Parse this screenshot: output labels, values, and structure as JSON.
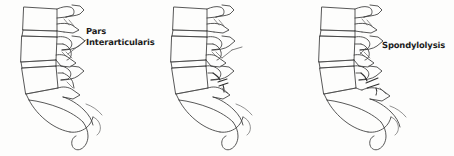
{
  "figure": {
    "type": "medical-line-illustration",
    "background_color": "#fdfdfc",
    "ink_color": "#3a3a3a",
    "text_color": "#1d1d1d",
    "panel_count": 3
  },
  "panels": [
    {
      "id": "normal",
      "label": "Pars\nInterarticularis",
      "label_lines": [
        "Pars",
        "Interarticularis"
      ],
      "condition": "normal pars interarticularis",
      "has_leader_line": true
    },
    {
      "id": "lysis",
      "label": "Spondylolysis",
      "label_lines": [
        "Spondylolysis"
      ],
      "condition": "pars interarticularis defect / fracture",
      "has_leader_line": true
    },
    {
      "id": "listhesis",
      "label": "Spondylolisthesis",
      "label_lines": [
        "Spondylolisthesis"
      ],
      "condition": "anterior slippage of vertebral body",
      "has_leader_line": true
    }
  ]
}
